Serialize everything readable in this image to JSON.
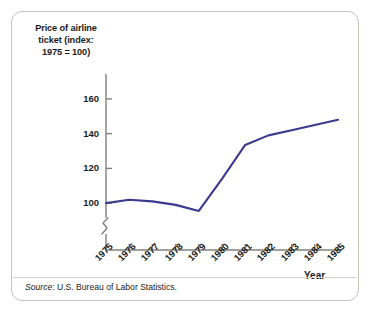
{
  "figure": {
    "y_axis_title": [
      "Price of airline",
      "ticket (index:",
      "1975 = 100)"
    ],
    "x_axis_name": "Year",
    "source_prefix": "Source",
    "source_text": ": U.S. Bureau of Labor Statistics.",
    "line_color": "#3b3a8c",
    "axis_color": "#808080",
    "border_color": "#c8c4bc"
  },
  "chart_data": {
    "type": "line",
    "title": "Price of airline ticket (index: 1975 = 100)",
    "xlabel": "Year",
    "ylabel": "Price of airline ticket (index: 1975 = 100)",
    "x": [
      1975,
      1976,
      1977,
      1978,
      1979,
      1980,
      1981,
      1982,
      1983,
      1984,
      1985
    ],
    "categories": [
      "1975",
      "1976",
      "1977",
      "1978",
      "1979",
      "1980",
      "1981",
      "1982",
      "1983",
      "1984",
      "1985"
    ],
    "values": [
      100,
      102,
      101,
      99,
      95.5,
      114,
      133.5,
      139,
      142,
      145,
      148
    ],
    "series": [
      {
        "name": "Price of airline ticket (index: 1975 = 100)",
        "values": [
          100,
          102,
          101,
          99,
          95.5,
          114,
          133.5,
          139,
          142,
          145,
          148
        ]
      }
    ],
    "ytick_labels": [
      "160",
      "140",
      "120",
      "100"
    ],
    "yticks": [
      160,
      140,
      120,
      100
    ],
    "ylim": [
      88,
      168
    ],
    "xlim": [
      1975,
      1985
    ],
    "grid": false,
    "legend": false,
    "axis_break": true
  }
}
